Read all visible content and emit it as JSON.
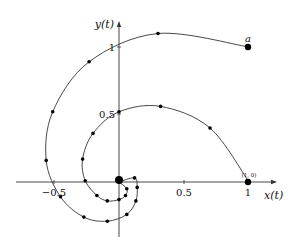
{
  "chart_data": {
    "type": "line",
    "title": "",
    "xlabel": "x(t)",
    "ylabel": "y(t)",
    "xlim": [
      -0.55,
      1.2
    ],
    "ylim": [
      -0.55,
      1.2
    ],
    "grid": false,
    "x_ticks": [
      {
        "value": -0.5,
        "label": "−0.5"
      },
      {
        "value": 0.5,
        "label": "0.5"
      },
      {
        "value": 1,
        "label": "1"
      }
    ],
    "y_ticks": [
      {
        "value": 0.5,
        "label": "0.5"
      },
      {
        "value": 1,
        "label": "1"
      }
    ],
    "annotations": [
      {
        "text": "a",
        "x": 1.0,
        "y": 1.0
      },
      {
        "text": "(1, 0)",
        "x": 1.0,
        "y": 0.0
      }
    ],
    "series": [
      {
        "name": "trajectory from a",
        "points": [
          [
            1.0,
            1.0
          ],
          [
            0.3,
            1.1
          ],
          [
            -0.23,
            0.89
          ],
          [
            -0.51,
            0.52
          ],
          [
            -0.56,
            0.16
          ],
          [
            -0.45,
            -0.11
          ],
          [
            -0.27,
            -0.26
          ],
          [
            -0.09,
            -0.29
          ],
          [
            0.06,
            -0.24
          ],
          [
            0.13,
            -0.14
          ],
          [
            0.14,
            -0.04
          ],
          [
            0.12,
            0.03
          ],
          [
            0.0,
            0.0
          ]
        ]
      },
      {
        "name": "trajectory from (1, 0)",
        "points": [
          [
            1.0,
            0.0
          ],
          [
            0.7,
            0.4
          ],
          [
            0.32,
            0.56
          ],
          [
            0.0,
            0.52
          ],
          [
            -0.2,
            0.36
          ],
          [
            -0.28,
            0.17
          ],
          [
            -0.26,
            0.01
          ],
          [
            -0.17,
            -0.1
          ],
          [
            -0.09,
            -0.14
          ],
          [
            0.0,
            -0.13
          ],
          [
            0.05,
            -0.1
          ],
          [
            0.06,
            -0.05
          ],
          [
            0.0,
            0.0
          ]
        ]
      }
    ],
    "pixel_map": {
      "origin_x": 119,
      "origin_y": 182,
      "scale_x": 130,
      "scale_y": 135
    }
  }
}
